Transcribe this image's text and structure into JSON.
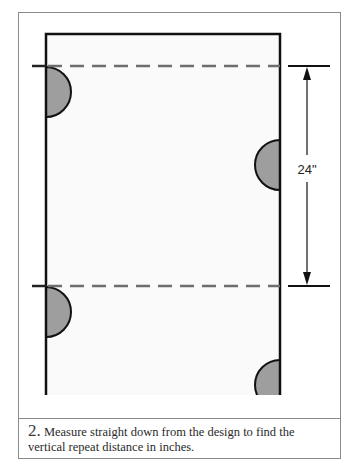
{
  "figure": {
    "dimension_label": "24\"",
    "colors": {
      "panel_fill": "#fafafa",
      "motif_fill": "#9e9e9e",
      "outline": "#111111",
      "dashed_line": "#6e6e6e",
      "frame_border": "#8a8a8a"
    },
    "motifs": [
      {
        "side": "left",
        "position": "upper"
      },
      {
        "side": "right",
        "position": "middle"
      },
      {
        "side": "left",
        "position": "lower"
      },
      {
        "side": "right",
        "position": "bottom"
      }
    ],
    "repeat_lines": [
      "upper",
      "lower"
    ]
  },
  "caption": {
    "step_number": "2.",
    "text": " Measure straight down from the design to find the vertical repeat distance in inches."
  }
}
